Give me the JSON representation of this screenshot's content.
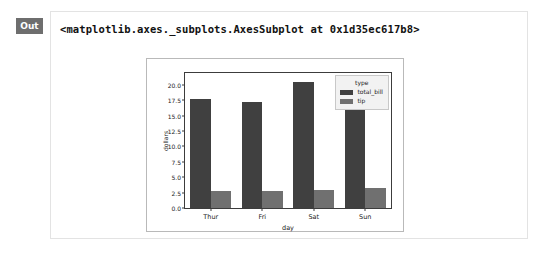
{
  "cell": {
    "out_label": "Out",
    "repr_text": "<matplotlib.axes._subplots.AxesSubplot at 0x1d35ec617b8>"
  },
  "colors": {
    "total_bill": "#404040",
    "tip": "#707070",
    "axes_edge": "#3c3c3c",
    "figure_border": "#b9b9b9",
    "panel_border": "#e3e3e3",
    "badge_bg": "#6e6e6e",
    "legend_bg": "#f2f2f2",
    "legend_border": "#c8c8c8"
  },
  "chart_data": {
    "type": "bar",
    "title": "",
    "xlabel": "day",
    "ylabel": "dollars",
    "categories": [
      "Thur",
      "Fri",
      "Sat",
      "Sun"
    ],
    "series": [
      {
        "name": "total_bill",
        "values": [
          17.68,
          17.15,
          20.44,
          21.41
        ],
        "color": "#404040"
      },
      {
        "name": "tip",
        "values": [
          2.77,
          2.73,
          2.99,
          3.26
        ],
        "color": "#707070"
      }
    ],
    "ylim": [
      0,
      21.9
    ],
    "yticks": [
      0.0,
      2.5,
      5.0,
      7.5,
      10.0,
      12.5,
      15.0,
      17.5,
      20.0
    ],
    "ytick_labels": [
      "0.0",
      "2.5",
      "5.0",
      "7.5",
      "10.0",
      "12.5",
      "15.0",
      "17.5",
      "20.0"
    ],
    "grid": false,
    "legend": {
      "title": "type",
      "position": "upper right",
      "entries": [
        "total_bill",
        "tip"
      ]
    }
  }
}
